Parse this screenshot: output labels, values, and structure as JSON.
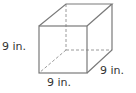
{
  "figure": {
    "type": "cube",
    "stroke_color": "#7a7a7a",
    "hidden_stroke_color": "#9a9a9a",
    "background": "#ffffff",
    "vertices": {
      "front_top_left": [
        39,
        26
      ],
      "front_top_right": [
        87,
        26
      ],
      "front_bottom_left": [
        39,
        73
      ],
      "front_bottom_right": [
        87,
        73
      ],
      "back_top_left": [
        66,
        4
      ],
      "back_top_right": [
        112,
        4
      ],
      "back_bottom_right": [
        112,
        50
      ],
      "back_bottom_left": [
        66,
        50
      ]
    }
  },
  "labels": {
    "height": "9 in.",
    "width": "9 in.",
    "depth": "9 in."
  }
}
